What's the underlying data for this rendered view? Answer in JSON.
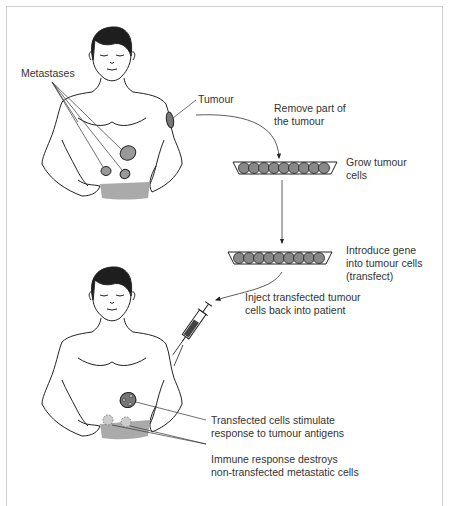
{
  "diagram": {
    "colors": {
      "outline": "#222222",
      "tumour_fill": "#777777",
      "metastasis_fill": "#999999",
      "waistband_fill": "#aaaaaa",
      "cell_fill": "#888888",
      "destroyed_fill": "#bbbbbb",
      "label_text": "#333333",
      "frame": "#cfcfcf"
    },
    "labels": {
      "metastases": "Metastases",
      "tumour": "Tumour",
      "remove": [
        "Remove part of",
        "the tumour"
      ],
      "grow": [
        "Grow tumour",
        "cells"
      ],
      "introduce": [
        "Introduce gene",
        "into tumour cells",
        "(transfect)"
      ],
      "inject": [
        "Inject transfected tumour",
        "cells back into patient"
      ],
      "stimulate": [
        "Transfected cells stimulate",
        "response to tumour antigens"
      ],
      "immune": [
        "Immune response destroys",
        "non-transfected metastatic cells"
      ]
    },
    "nodes": [
      {
        "id": "patient-before",
        "label": "Patient with tumour and metastases"
      },
      {
        "id": "dish-1",
        "label": "Culture dish of tumour cells",
        "cell_count": 10
      },
      {
        "id": "dish-2",
        "label": "Culture dish of transfected cells",
        "cell_count": 10
      },
      {
        "id": "syringe",
        "label": "Syringe"
      },
      {
        "id": "patient-after",
        "label": "Patient after injection"
      }
    ],
    "edges": [
      {
        "from": "patient-before",
        "to": "dish-1",
        "label": "Remove part of the tumour"
      },
      {
        "from": "dish-1",
        "to": "dish-2",
        "label": "Introduce gene into tumour cells (transfect)"
      },
      {
        "from": "dish-2",
        "to": "syringe",
        "label": "Inject transfected tumour cells back into patient"
      }
    ]
  }
}
